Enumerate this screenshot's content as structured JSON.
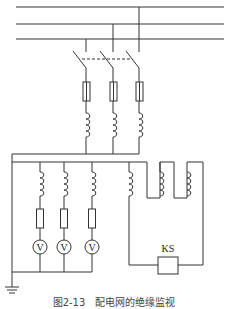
{
  "diagram": {
    "caption": "图2-13　配电网的绝缘监视",
    "buses": [
      "phase-bus-1",
      "phase-bus-2",
      "phase-bus-3"
    ],
    "switch": "three-pole-isolating-switch",
    "voltmeters": [
      {
        "label": "V"
      },
      {
        "label": "V"
      },
      {
        "label": "V"
      }
    ],
    "relay": {
      "label": "KS"
    },
    "ground": "ground-symbol"
  }
}
